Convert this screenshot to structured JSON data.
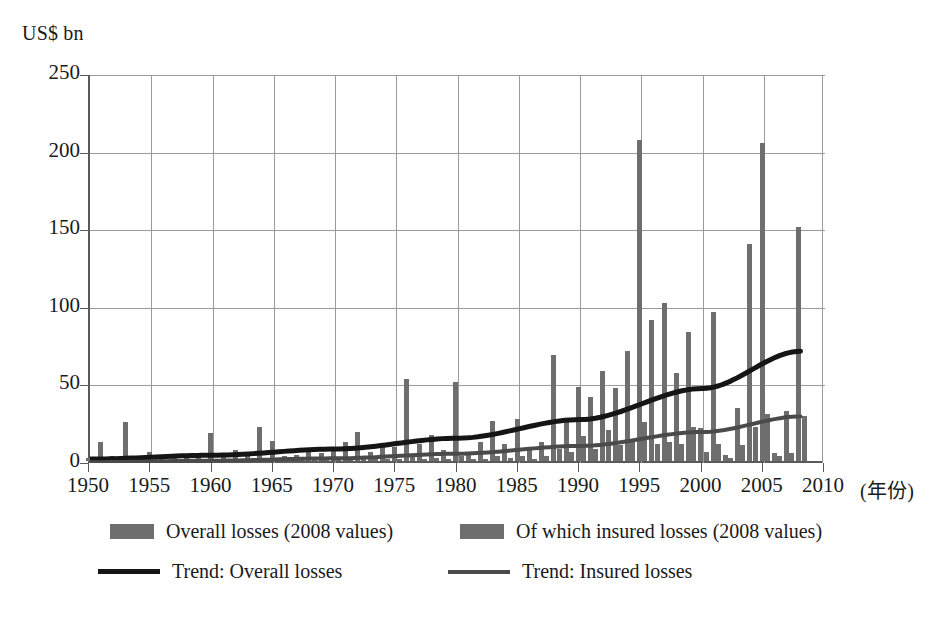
{
  "chart_data": {
    "type": "bar",
    "title": "",
    "subtitle": "",
    "ylabel": "US$ bn",
    "xlabel": "(年份)",
    "ylim": [
      0,
      250
    ],
    "yticks": [
      0,
      50,
      100,
      150,
      200,
      250
    ],
    "xlim": [
      1950,
      2010
    ],
    "xticks": [
      1950,
      1955,
      1960,
      1965,
      1970,
      1975,
      1980,
      1985,
      1990,
      1995,
      2000,
      2005,
      2010
    ],
    "grid": true,
    "legend_position": "bottom",
    "x": [
      1950,
      1951,
      1952,
      1953,
      1954,
      1955,
      1956,
      1957,
      1958,
      1959,
      1960,
      1961,
      1962,
      1963,
      1964,
      1965,
      1966,
      1967,
      1968,
      1969,
      1970,
      1971,
      1972,
      1973,
      1974,
      1975,
      1976,
      1977,
      1978,
      1979,
      1980,
      1981,
      1982,
      1983,
      1984,
      1985,
      1986,
      1987,
      1988,
      1989,
      1990,
      1991,
      1992,
      1993,
      1994,
      1995,
      1996,
      1997,
      1998,
      1999,
      2000,
      2001,
      2002,
      2003,
      2004,
      2005,
      2006,
      2007,
      2008
    ],
    "series": [
      {
        "name": "Overall losses (2008 values)",
        "type": "bar",
        "color": "#6e6e6e",
        "values": [
          2,
          12,
          3,
          25,
          3,
          6,
          2,
          3,
          4,
          3,
          18,
          3,
          7,
          4,
          22,
          13,
          3,
          4,
          6,
          5,
          8,
          12,
          19,
          6,
          11,
          9,
          53,
          11,
          17,
          7,
          51,
          6,
          12,
          26,
          11,
          27,
          7,
          12,
          68,
          28,
          48,
          41,
          58,
          47,
          71,
          207,
          91,
          102,
          57,
          83,
          21,
          96,
          4,
          34,
          140,
          205,
          5,
          32,
          151
        ]
      },
      {
        "name": "Of which insured losses (2008 values)",
        "type": "bar",
        "color": "#6e6e6e",
        "values": [
          0,
          1,
          0,
          2,
          0,
          1,
          0,
          0,
          0,
          0,
          1,
          0,
          1,
          0,
          2,
          1,
          0,
          0,
          1,
          1,
          1,
          1,
          2,
          1,
          1,
          1,
          3,
          1,
          2,
          1,
          3,
          1,
          1,
          3,
          2,
          3,
          1,
          3,
          8,
          6,
          16,
          8,
          20,
          10,
          14,
          25,
          11,
          12,
          11,
          22,
          6,
          11,
          2,
          10,
          22,
          30,
          3,
          5,
          29
        ]
      },
      {
        "name": "Trend: Overall losses",
        "type": "line",
        "color": "#151515",
        "points": [
          [
            1950,
            2.5
          ],
          [
            1960,
            5
          ],
          [
            1970,
            9
          ],
          [
            1980,
            16
          ],
          [
            1990,
            28
          ],
          [
            2000,
            48
          ],
          [
            2008,
            72
          ]
        ]
      },
      {
        "name": "Trend: Insured losses",
        "type": "line",
        "color": "#4a4a4a",
        "points": [
          [
            1950,
            0.5
          ],
          [
            1960,
            1.5
          ],
          [
            1970,
            3
          ],
          [
            1980,
            6
          ],
          [
            1990,
            11
          ],
          [
            2000,
            20
          ],
          [
            2008,
            30
          ]
        ]
      }
    ]
  },
  "yaxis": {
    "unit_label": "US$ bn",
    "ticks": [
      "0",
      "50",
      "100",
      "150",
      "200",
      "250"
    ]
  },
  "xaxis": {
    "unit_label": "(年份)",
    "ticks": [
      "1950",
      "1955",
      "1960",
      "1965",
      "1970",
      "1975",
      "1980",
      "1985",
      "1990",
      "1995",
      "2000",
      "2005",
      "2010"
    ]
  },
  "legend": {
    "items": [
      {
        "label": "Overall losses (2008 values)",
        "marker": "swatch",
        "color": "#6e6e6e"
      },
      {
        "label": "Of which insured losses (2008 values)",
        "marker": "swatch",
        "color": "#6e6e6e"
      },
      {
        "label": "Trend: Overall losses",
        "marker": "line-thick",
        "color": "#151515"
      },
      {
        "label": "Trend: Insured losses",
        "marker": "line-thin",
        "color": "#4a4a4a"
      }
    ]
  }
}
